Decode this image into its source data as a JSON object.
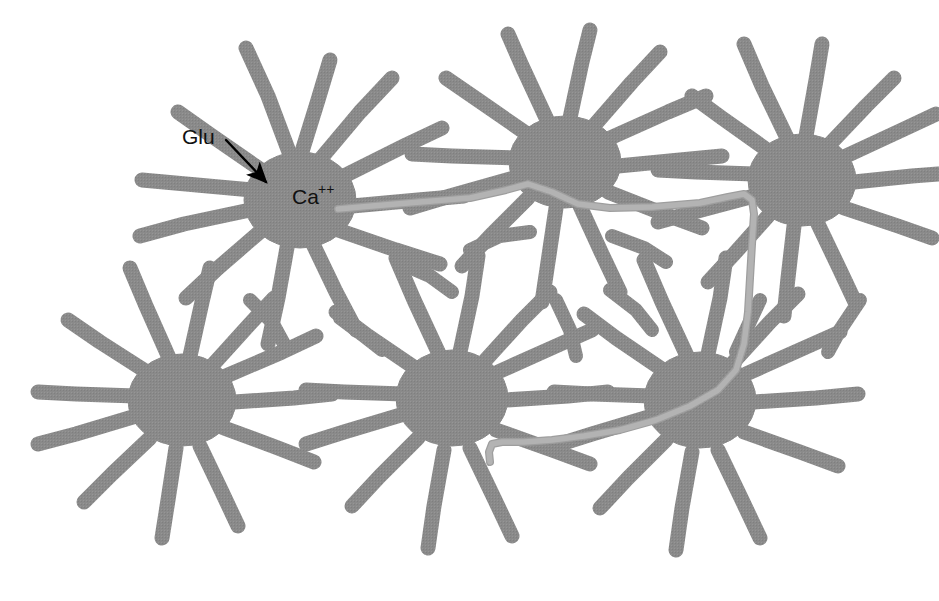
{
  "figure": {
    "domain": "Diagram",
    "width": 939,
    "height": 601,
    "background_color": "#ffffff"
  },
  "colors": {
    "cell_gray": "#8a8a8a",
    "cell_gray_texture": "#8f8f8f",
    "wave_line_gray": "#b3b3b3",
    "wave_line_edge": "#9e9e9e",
    "background": "#ffffff",
    "label_black": "#111111",
    "arrow_black": "#000000"
  },
  "labels": {
    "glutamate": {
      "text": "Glu",
      "x": 182,
      "y": 144,
      "font_size": 21
    },
    "calcium": {
      "base_text": "Ca",
      "superscript_text": "++",
      "full_text": "Ca++",
      "x": 292,
      "y": 204,
      "font_size": 21,
      "superscript_font_size": 14
    }
  },
  "arrow": {
    "name": "glu-to-ca-arrow",
    "start_x": 226,
    "start_y": 140,
    "end_x": 270,
    "end_y": 186,
    "stroke_width": 2.4,
    "head_length": 16,
    "head_width": 11
  },
  "cells": [
    {
      "id": "astrocyte-upper-left",
      "label": "Upper-left astrocyte (Ca++ source)",
      "cx": 300,
      "cy": 200,
      "soma_rx": 58,
      "soma_ry": 50,
      "process_count": 12
    },
    {
      "id": "astrocyte-upper-middle",
      "label": "Upper-middle astrocyte",
      "cx": 565,
      "cy": 160,
      "soma_rx": 58,
      "soma_ry": 48,
      "process_count": 12
    },
    {
      "id": "astrocyte-upper-right",
      "label": "Upper-right astrocyte",
      "cx": 800,
      "cy": 178,
      "soma_rx": 56,
      "soma_ry": 48,
      "process_count": 12
    },
    {
      "id": "astrocyte-left",
      "label": "Left astrocyte",
      "cx": 185,
      "cy": 400,
      "soma_rx": 56,
      "soma_ry": 48,
      "process_count": 12
    },
    {
      "id": "astrocyte-bottom-middle",
      "label": "Bottom-middle astrocyte",
      "cx": 455,
      "cy": 395,
      "soma_rx": 58,
      "soma_ry": 50,
      "process_count": 12
    },
    {
      "id": "astrocyte-bottom-right",
      "label": "Bottom-right astrocyte",
      "cx": 700,
      "cy": 400,
      "soma_rx": 58,
      "soma_ry": 50,
      "process_count": 12
    }
  ],
  "wave_path": {
    "name": "calcium-wave-path",
    "description": "Light gray line tracing calcium wave spread from the Ca++ cell through the astrocyte syncytium",
    "stroke_width": 6.5,
    "color": "#b3b3b3",
    "points": "M 338 209 L 372 206 L 420 202 L 470 198 L 506 190 L 528 184 L 552 192 L 578 204 L 610 208 L 652 207 L 700 203 L 728 197 L 744 194 L 752 200 L 754 214 L 752 244 L 750 278 L 748 312 L 744 344 L 736 370 L 718 390 L 690 406 L 656 420 L 620 430 L 584 436 L 552 440 L 524 442 L 502 442 L 492 444 L 489 452 L 490 462"
  }
}
